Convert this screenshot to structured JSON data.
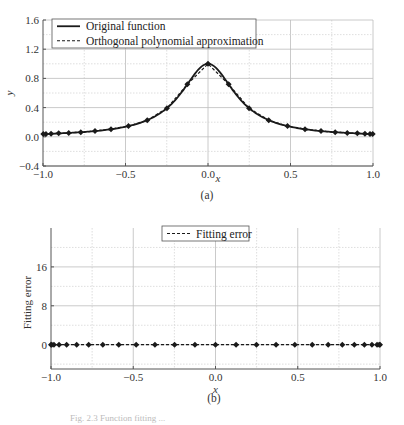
{
  "figure": {
    "caption_a": "(a)",
    "caption_b": "(b)",
    "bottom_caption_faint": "Fig. 2.3  Function fitting ..."
  },
  "chart_data": [
    {
      "id": "a",
      "type": "line",
      "title": "",
      "xlabel": "x",
      "ylabel": "y",
      "xlim": [
        -1.0,
        1.0
      ],
      "ylim": [
        -0.4,
        1.6
      ],
      "xticks": [
        "-1.0",
        "-0.5",
        "0.0",
        "0.5",
        "1.0"
      ],
      "xtick_values": [
        -1.0,
        -0.5,
        0.0,
        0.5,
        1.0
      ],
      "yticks": [
        "-0.4",
        "0.0",
        "0.4",
        "0.8",
        "1.2",
        "1.6"
      ],
      "ytick_values": [
        -0.4,
        0.0,
        0.4,
        0.8,
        1.2,
        1.6
      ],
      "grid": true,
      "legend_position": "upper-left",
      "series": [
        {
          "name": "Original function",
          "style": "solid",
          "function": "1/(1+25x^2)",
          "x": [
            -1.0,
            -0.9,
            -0.8,
            -0.7,
            -0.6,
            -0.5,
            -0.4,
            -0.3,
            -0.2,
            -0.1,
            0.0,
            0.1,
            0.2,
            0.3,
            0.4,
            0.5,
            0.6,
            0.7,
            0.8,
            0.9,
            1.0
          ],
          "values": [
            0.038,
            0.047,
            0.059,
            0.075,
            0.1,
            0.138,
            0.2,
            0.308,
            0.5,
            0.8,
            1.0,
            0.8,
            0.5,
            0.308,
            0.2,
            0.138,
            0.1,
            0.075,
            0.059,
            0.047,
            0.038
          ]
        },
        {
          "name": "Orthogonal polynomial approximation",
          "style": "dashed",
          "marker": "diamond",
          "x": [
            -0.998,
            -0.982,
            -0.951,
            -0.905,
            -0.844,
            -0.771,
            -0.685,
            -0.588,
            -0.482,
            -0.368,
            -0.249,
            -0.125,
            0.0,
            0.125,
            0.249,
            0.368,
            0.482,
            0.588,
            0.685,
            0.771,
            0.844,
            0.905,
            0.951,
            0.982,
            0.998
          ],
          "values": [
            0.039,
            0.04,
            0.042,
            0.047,
            0.053,
            0.063,
            0.079,
            0.104,
            0.147,
            0.228,
            0.392,
            0.719,
            1.0,
            0.719,
            0.392,
            0.228,
            0.147,
            0.104,
            0.079,
            0.063,
            0.053,
            0.047,
            0.042,
            0.04,
            0.039
          ]
        }
      ]
    },
    {
      "id": "b",
      "type": "line",
      "title": "",
      "xlabel": "x",
      "ylabel": "Fitting error",
      "xlim": [
        -1.0,
        1.0
      ],
      "ylim": [
        -5,
        24
      ],
      "xticks": [
        "-1.0",
        "-0.5",
        "0.0",
        "0.5",
        "1.0"
      ],
      "xtick_values": [
        -1.0,
        -0.5,
        0.0,
        0.5,
        1.0
      ],
      "yticks": [
        "0",
        "8",
        "16"
      ],
      "ytick_values": [
        0,
        8,
        16
      ],
      "grid": true,
      "legend_position": "upper-center",
      "series": [
        {
          "name": "Fitting error",
          "style": "dashed",
          "marker": "diamond",
          "x": [
            -1.0,
            -0.995,
            -0.982,
            -0.951,
            -0.905,
            -0.844,
            -0.771,
            -0.685,
            -0.588,
            -0.482,
            -0.368,
            -0.249,
            -0.125,
            0.0,
            0.125,
            0.249,
            0.368,
            0.482,
            0.588,
            0.685,
            0.771,
            0.844,
            0.905,
            0.951,
            0.982,
            0.995,
            1.0
          ],
          "values": [
            0,
            0,
            0,
            0,
            0,
            0,
            0,
            0,
            0,
            0,
            0,
            0,
            0,
            0,
            0,
            0,
            0,
            0,
            0,
            0,
            0,
            0,
            0,
            0,
            0,
            0,
            0
          ]
        }
      ]
    }
  ],
  "layout": {
    "a": {
      "left": 43,
      "right": 373,
      "top": 20,
      "bottom": 166,
      "legend": {
        "x": 52,
        "y": 19,
        "w": 204,
        "h": 29
      }
    },
    "b": {
      "left": 51,
      "right": 380,
      "top": 228,
      "bottom": 369,
      "legend": {
        "x": 162,
        "y": 226,
        "w": 87,
        "h": 15
      }
    }
  },
  "colors": {
    "line": "#1a1a1a",
    "grid_major": "#bdbdbd",
    "grid_minor": "#d6d6d6",
    "axis": "#555555"
  }
}
